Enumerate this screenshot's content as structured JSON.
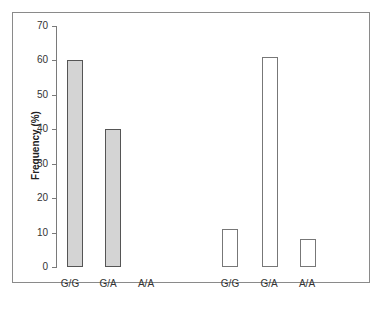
{
  "chart_data": {
    "type": "bar",
    "title": "",
    "xlabel": "",
    "ylabel": "Frequency  (%)",
    "ylim": [
      0,
      70
    ],
    "yticks": [
      "0",
      "10",
      "20",
      "30",
      "40",
      "50",
      "60",
      "70"
    ],
    "grid": false,
    "groups": [
      {
        "name": "group-1",
        "style": "filled-gray",
        "categories": [
          "G/G",
          "G/A",
          "A/A"
        ],
        "values": [
          60,
          40,
          0
        ]
      },
      {
        "name": "group-2",
        "style": "outline-white",
        "categories": [
          "G/G",
          "G/A",
          "A/A"
        ],
        "values": [
          11,
          61,
          8
        ]
      }
    ]
  },
  "labels": {
    "ylabel": "Frequency  (%)",
    "t0": "0",
    "t10": "10",
    "t20": "20",
    "t30": "30",
    "t40": "40",
    "t50": "50",
    "t60": "60",
    "t70": "70",
    "g1c1": "G/G",
    "g1c2": "G/A",
    "g1c3": "A/A",
    "g2c1": "G/G",
    "g2c2": "G/A",
    "g2c3": "A/A"
  }
}
